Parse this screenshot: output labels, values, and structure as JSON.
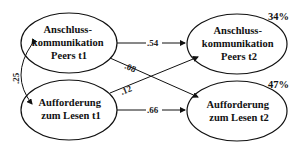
{
  "diagram": {
    "type": "path-model",
    "nodes": [
      {
        "id": "anschluss_t1",
        "lines": [
          "Anschluss-",
          "kommunikation",
          "Peers t1"
        ]
      },
      {
        "id": "aufforderung_t1",
        "lines": [
          "Aufforderung",
          "zum Lesen t1"
        ]
      },
      {
        "id": "anschluss_t2",
        "lines": [
          "Anschluss-",
          "kommunikation",
          "Peers t2"
        ],
        "r2": "34%"
      },
      {
        "id": "aufforderung_t2",
        "lines": [
          "Aufforderung",
          "zum Lesen t2"
        ],
        "r2": "47%"
      }
    ],
    "edges": [
      {
        "from": "anschluss_t1",
        "to": "anschluss_t2",
        "label": ".54"
      },
      {
        "from": "anschluss_t1",
        "to": "aufforderung_t2",
        "label": ".08"
      },
      {
        "from": "aufforderung_t1",
        "to": "anschluss_t2",
        "label": ".12"
      },
      {
        "from": "aufforderung_t1",
        "to": "aufforderung_t2",
        "label": ".66"
      },
      {
        "from": "anschluss_t1",
        "to": "aufforderung_t1",
        "label": ".25",
        "type": "correlation"
      }
    ]
  }
}
